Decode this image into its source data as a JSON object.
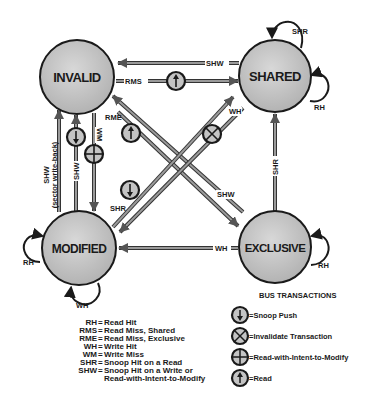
{
  "diagram": {
    "states": {
      "invalid": {
        "label": "INVALID"
      },
      "shared": {
        "label": "SHARED"
      },
      "modified": {
        "label": "MODIFIED"
      },
      "exclusive": {
        "label": "EXCLUSIVE"
      }
    },
    "transitions": {
      "shared_to_invalid_top": {
        "label": "SHW",
        "from": "SHARED",
        "to": "INVALID"
      },
      "invalid_to_shared": {
        "label": "RMS",
        "from": "INVALID",
        "to": "SHARED",
        "bus": "Read"
      },
      "invalid_to_exclusive": {
        "label": "RME",
        "from": "INVALID",
        "to": "EXCLUSIVE",
        "bus": "Read"
      },
      "exclusive_to_invalid": {
        "label": "SHW",
        "from": "EXCLUSIVE",
        "to": "INVALID"
      },
      "shared_to_modified": {
        "label": "WH",
        "from": "SHARED",
        "to": "MODIFIED",
        "bus": "Invalidate Transaction"
      },
      "modified_to_shared": {
        "label": "SHR",
        "from": "MODIFIED",
        "to": "SHARED",
        "bus": "Snoop Push"
      },
      "exclusive_to_shared": {
        "label": "SHR",
        "from": "EXCLUSIVE",
        "to": "SHARED"
      },
      "exclusive_to_modified": {
        "label": "WH",
        "from": "EXCLUSIVE",
        "to": "MODIFIED"
      },
      "modified_to_invalid_writeback": {
        "label": "SHW",
        "sublabel": "(sector write-back)",
        "from": "MODIFIED",
        "to": "INVALID"
      },
      "modified_to_invalid": {
        "label": "SHW",
        "from": "MODIFIED",
        "to": "INVALID",
        "bus": "Snoop Push"
      },
      "invalid_to_modified": {
        "label": "WM",
        "from": "INVALID",
        "to": "MODIFIED",
        "bus": "Read-with-Intent-to-Modify"
      },
      "shared_self_shr": {
        "label": "SHR"
      },
      "shared_self_rh": {
        "label": "RH"
      },
      "exclusive_self_rh": {
        "label": "RH"
      },
      "modified_self_rh": {
        "label": "RH"
      },
      "modified_self_wh": {
        "label": "WH"
      }
    },
    "legend": [
      {
        "abbr": "RH",
        "meaning": "Read Hit"
      },
      {
        "abbr": "RMS",
        "meaning": "Read Miss, Shared"
      },
      {
        "abbr": "RME",
        "meaning": "Read Miss, Exclusive"
      },
      {
        "abbr": "WH",
        "meaning": "Write Hit"
      },
      {
        "abbr": "WM",
        "meaning": "Write Miss"
      },
      {
        "abbr": "SHR",
        "meaning": "Snoop Hit on a Read"
      },
      {
        "abbr": "SHW",
        "meaning": "Snoop Hit on a Write or",
        "meaning2": "Read-with-Intent-to-Modify"
      }
    ],
    "bus_transactions": {
      "title": "BUS TRANSACTIONS",
      "items": [
        {
          "icon": "snoop-push-icon",
          "label": "=Snoop Push"
        },
        {
          "icon": "invalidate-icon",
          "label": "=Invalidate Transaction"
        },
        {
          "icon": "rwitm-icon",
          "label": "=Read-with-Intent-to-Modify"
        },
        {
          "icon": "read-icon",
          "label": "=Read"
        }
      ]
    },
    "colors": {
      "state_fill": "#c4c4c4",
      "state_stroke": "#1a1a1a",
      "arrow": "#7a7a7a",
      "arrow_edge": "#2a2a2a"
    }
  }
}
